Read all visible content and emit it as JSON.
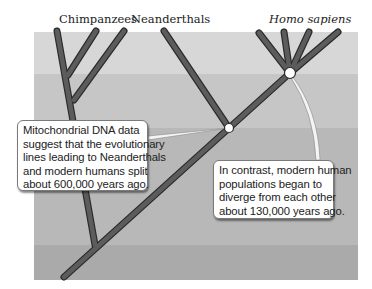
{
  "labels": {
    "chimpanzees": "Chimpanzees",
    "neanderthals": "Neanderthals",
    "homo_sapiens": "Homo sapiens"
  },
  "callouts": {
    "mtdna": {
      "lines": [
        "Mitochondrial DNA data",
        "suggest that the evolutionary",
        "lines leading to Neanderthals",
        "and modern humans split",
        "about 600,000 years ago."
      ]
    },
    "divergence": {
      "lines": [
        "In contrast, modern human",
        "populations began to",
        "diverge from each other",
        "about 130,000 years ago."
      ]
    }
  },
  "colors": {
    "band_1": "#d6d6d6",
    "band_2": "#c4c4c4",
    "band_3": "#b6b6b6",
    "band_4": "#a9a9a9",
    "branch": "#5a5a5a",
    "branch_outline": "#2a2a2a",
    "node": "#ffffff"
  }
}
